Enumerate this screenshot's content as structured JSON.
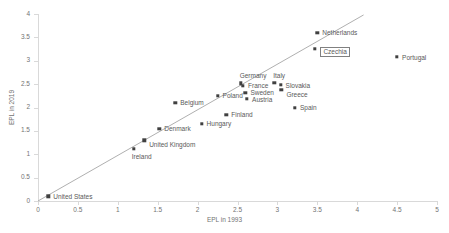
{
  "chart_data": {
    "type": "scatter",
    "title": "",
    "xlabel": "EPL in 1993",
    "ylabel": "EPL in 2019",
    "xlim": [
      0,
      5
    ],
    "ylim": [
      0,
      4
    ],
    "xticks": [
      "0",
      "0.5",
      "1",
      "1.5",
      "2",
      "2.5",
      "3",
      "3.5",
      "4",
      "4.5",
      "5"
    ],
    "yticks": [
      "0",
      "0.5",
      "1",
      "1.5",
      "2",
      "2.5",
      "3",
      "3.5",
      "4"
    ],
    "grid": false,
    "legend": "none",
    "trendline": {
      "x0": 0.0,
      "y0": 0.0,
      "x1": 4.08,
      "y1": 3.98
    },
    "points": [
      {
        "name": "United States",
        "x": 0.13,
        "y": 0.1,
        "label_dx": 5,
        "label_dy": -2.5,
        "boxed": false
      },
      {
        "name": "Ireland",
        "x": 1.2,
        "y": 1.12,
        "label_dx": -2,
        "label_dy": 5,
        "boxed": false
      },
      {
        "name": "United Kingdom",
        "x": 1.33,
        "y": 1.3,
        "label_dx": 5,
        "label_dy": 1.5,
        "boxed": false
      },
      {
        "name": "Denmark",
        "x": 1.52,
        "y": 1.55,
        "label_dx": 5,
        "label_dy": -2.5,
        "boxed": false
      },
      {
        "name": "Belgium",
        "x": 1.72,
        "y": 2.1,
        "label_dx": 5,
        "label_dy": -2.5,
        "boxed": false
      },
      {
        "name": "Hungary",
        "x": 2.05,
        "y": 1.65,
        "label_dx": 5,
        "label_dy": -2.5,
        "boxed": false
      },
      {
        "name": "Finland",
        "x": 2.36,
        "y": 1.85,
        "label_dx": 5,
        "label_dy": -2.5,
        "boxed": false
      },
      {
        "name": "Poland",
        "x": 2.25,
        "y": 2.25,
        "label_dx": 5,
        "label_dy": -2.5,
        "boxed": false
      },
      {
        "name": "Germany",
        "x": 2.54,
        "y": 2.52,
        "label_dx": -1,
        "label_dy": -10,
        "boxed": false
      },
      {
        "name": "France",
        "x": 2.57,
        "y": 2.47,
        "label_dx": 5,
        "label_dy": -2.5,
        "boxed": false
      },
      {
        "name": "Sweden",
        "x": 2.6,
        "y": 2.32,
        "label_dx": 5,
        "label_dy": -2.5,
        "boxed": false
      },
      {
        "name": "Austria",
        "x": 2.62,
        "y": 2.18,
        "label_dx": 5,
        "label_dy": -2.5,
        "boxed": false
      },
      {
        "name": "Italy",
        "x": 2.96,
        "y": 2.53,
        "label_dx": -1,
        "label_dy": -10,
        "boxed": false
      },
      {
        "name": "Slovakia",
        "x": 3.04,
        "y": 2.48,
        "label_dx": 5,
        "label_dy": -2.5,
        "boxed": false
      },
      {
        "name": "Greece",
        "x": 3.05,
        "y": 2.38,
        "label_dx": 5,
        "label_dy": 2,
        "boxed": false
      },
      {
        "name": "Spain",
        "x": 3.22,
        "y": 2.0,
        "label_dx": 5,
        "label_dy": -2.5,
        "boxed": false
      },
      {
        "name": "Czechia",
        "x": 3.47,
        "y": 3.25,
        "label_dx": 5,
        "label_dy": -2.5,
        "boxed": true
      },
      {
        "name": "Netherlands",
        "x": 3.5,
        "y": 3.6,
        "label_dx": 5,
        "label_dy": -2.5,
        "boxed": false
      },
      {
        "name": "Portugal",
        "x": 4.5,
        "y": 3.08,
        "label_dx": 5,
        "label_dy": -2.5,
        "boxed": false
      }
    ]
  }
}
